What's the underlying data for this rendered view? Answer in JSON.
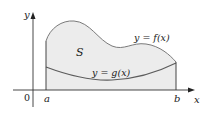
{
  "figure": {
    "region_label": "S",
    "upper_curve_label": "y = f(x)",
    "lower_curve_label": "y = g(x)",
    "axes": {
      "x_label": "x",
      "y_label": "y",
      "origin_label": "0"
    },
    "bounds": {
      "left_label": "a",
      "right_label": "b"
    },
    "colors": {
      "fill": "#ececec",
      "upper_curve": "#7a7a7a",
      "lower_curve": "#5c5c5c",
      "axes": "#333333",
      "text": "#1a1a1a"
    }
  }
}
